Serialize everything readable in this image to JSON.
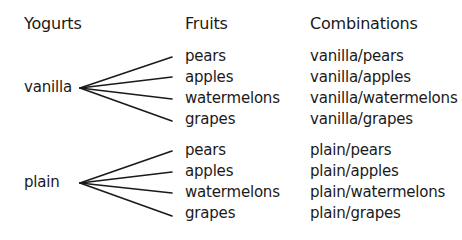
{
  "headers": {
    "yogurts": "Yogurts",
    "fruits": "Fruits",
    "combinations": "Combinations"
  },
  "groups": [
    {
      "yogurt": "vanilla",
      "fruits": [
        "pears",
        "apples",
        "watermelons",
        "grapes"
      ],
      "combinations": [
        "vanilla/pears",
        "vanilla/apples",
        "vanilla/watermelons",
        "vanilla/grapes"
      ]
    },
    {
      "yogurt": "plain",
      "fruits": [
        "pears",
        "apples",
        "watermelons",
        "grapes"
      ],
      "combinations": [
        "plain/pears",
        "plain/apples",
        "plain/watermelons",
        "plain/grapes"
      ]
    }
  ],
  "colors": {
    "text": "#1a1a1a",
    "lines": "#1a1a1a",
    "background": "#ffffff"
  }
}
